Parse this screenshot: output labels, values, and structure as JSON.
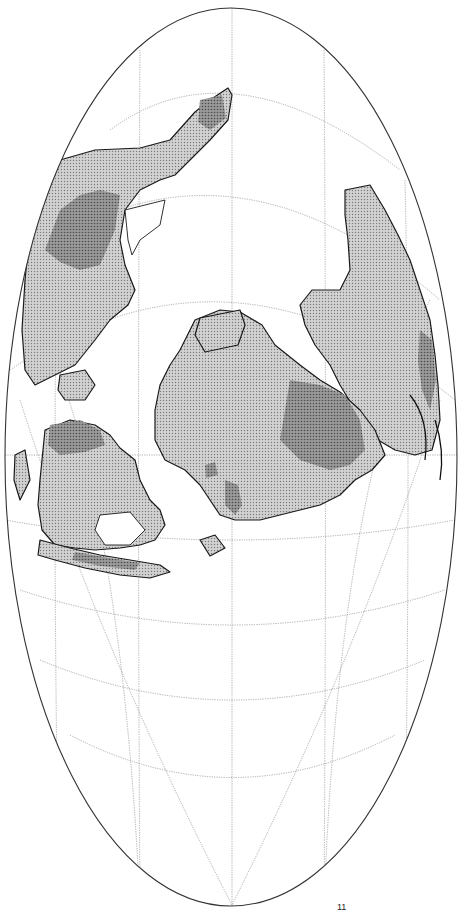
{
  "map": {
    "projection": "Mollweide (oblique, rotated)",
    "colors": {
      "background": "#ffffff",
      "land_lowland": "#c4c4c4",
      "land_highland": "#8e8e8e",
      "shelf": "#ffffff",
      "coastline": "#1a1a1a",
      "graticule": "#8a8a8a",
      "outline": "#333333"
    },
    "legend": [],
    "labels": [],
    "corner_mark": "11",
    "graticule": {
      "meridians_x": [
        58,
        140,
        232,
        324,
        405
      ],
      "equator_y": 455
    }
  }
}
